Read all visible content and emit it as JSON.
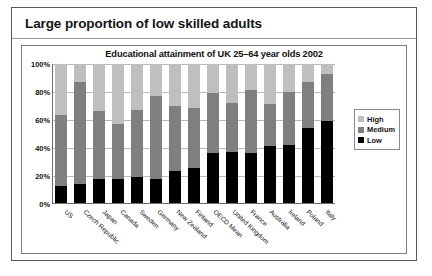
{
  "slide": {
    "title": "Large proportion of low skilled adults"
  },
  "chart_data": {
    "type": "bar",
    "subtype": "stacked-bar-100-percent",
    "title": "Educational attainment of UK 25–64 year olds 2002",
    "xlabel": "",
    "ylabel": "",
    "ylim": [
      0,
      100
    ],
    "ytick_labels": [
      "0%",
      "20%",
      "40%",
      "60%",
      "80%",
      "100%"
    ],
    "ytick_values": [
      0,
      20,
      40,
      60,
      80,
      100
    ],
    "grid": true,
    "legend_position": "right",
    "categories": [
      "US",
      "Czech Republic",
      "Japan",
      "Canada",
      "Sweden",
      "Germany",
      "New Zealand",
      "Finland",
      "OECD Mean",
      "United Kingdom",
      "France",
      "Australia",
      "Ireland",
      "Poland",
      "Italy"
    ],
    "series": [
      {
        "name": "Low",
        "color": "#000000",
        "values": [
          12,
          14,
          17,
          17,
          19,
          17,
          23,
          25,
          36,
          37,
          36,
          41,
          42,
          54,
          59
        ]
      },
      {
        "name": "Medium",
        "color": "#7f7f7f",
        "values": [
          51,
          73,
          49,
          40,
          48,
          60,
          47,
          43,
          43,
          35,
          45,
          30,
          38,
          33,
          34
        ]
      },
      {
        "name": "High",
        "color": "#bfbfbf",
        "values": [
          37,
          13,
          34,
          43,
          33,
          23,
          30,
          32,
          21,
          28,
          19,
          29,
          20,
          13,
          7
        ]
      }
    ],
    "legend": [
      {
        "label": "High",
        "color": "#bfbfbf"
      },
      {
        "label": "Medium",
        "color": "#7f7f7f"
      },
      {
        "label": "Low",
        "color": "#000000"
      }
    ]
  }
}
